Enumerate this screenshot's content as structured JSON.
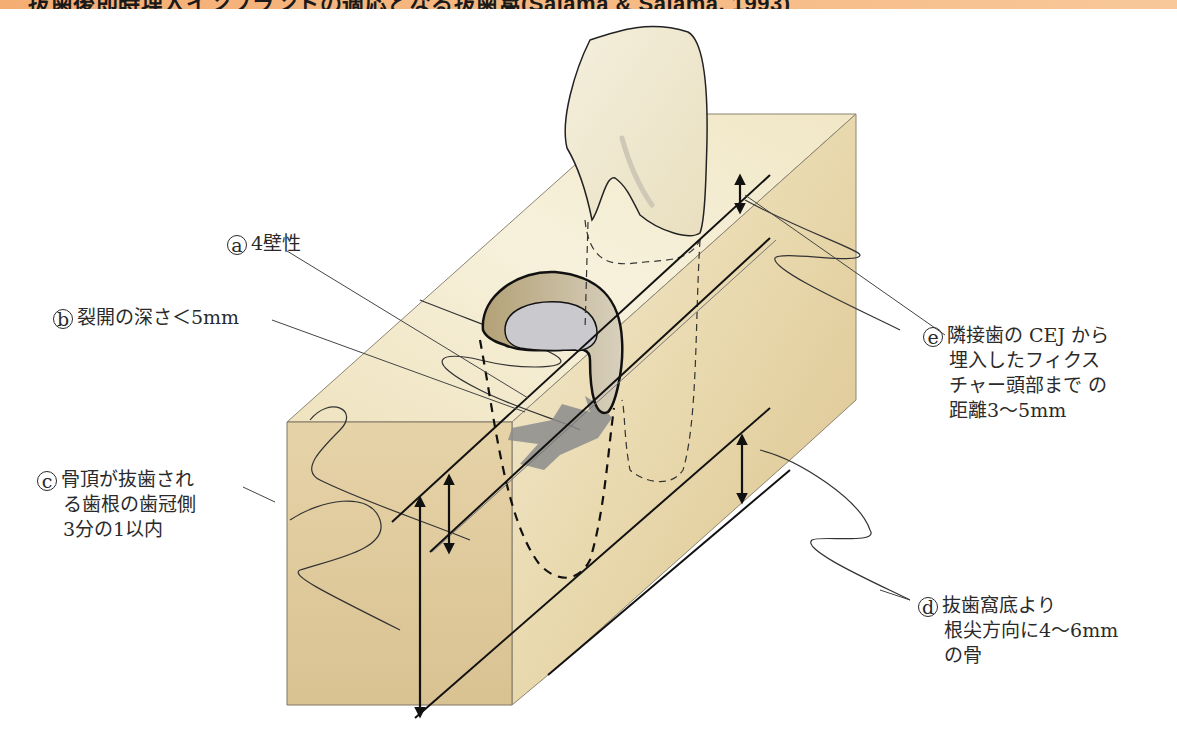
{
  "header": {
    "title": "抜歯後即時埋入インプラントの適応となる抜歯窩(Salama & Salama, 1993)",
    "bar_color": "#f4ae74"
  },
  "diagram": {
    "colors": {
      "bone_front": "#dcc79a",
      "bone_top": "#f3ecd2",
      "bone_side": "#e8d9b0",
      "socket_wall": "#bfae86",
      "socket_floor": "#c9c9cc",
      "dehiscence_shadow": "#8a8a8a",
      "tooth": "#f2ecd6",
      "line": "#111111"
    }
  },
  "labels": {
    "a": {
      "marker": "a",
      "lines": [
        "4壁性"
      ]
    },
    "b": {
      "marker": "b",
      "lines": [
        "裂開の深さ＜5mm"
      ]
    },
    "c": {
      "marker": "c",
      "lines": [
        "骨頂が抜歯され",
        "る歯根の歯冠側",
        "3分の1以内"
      ]
    },
    "d": {
      "marker": "d",
      "lines": [
        "抜歯窩底より",
        "根尖方向に4～6mm",
        "の骨"
      ]
    },
    "e": {
      "marker": "e",
      "lines": [
        "隣接歯の CEJ から",
        "埋入したフィクス",
        "チャー頭部まで の",
        "距離3～5mm"
      ]
    }
  }
}
